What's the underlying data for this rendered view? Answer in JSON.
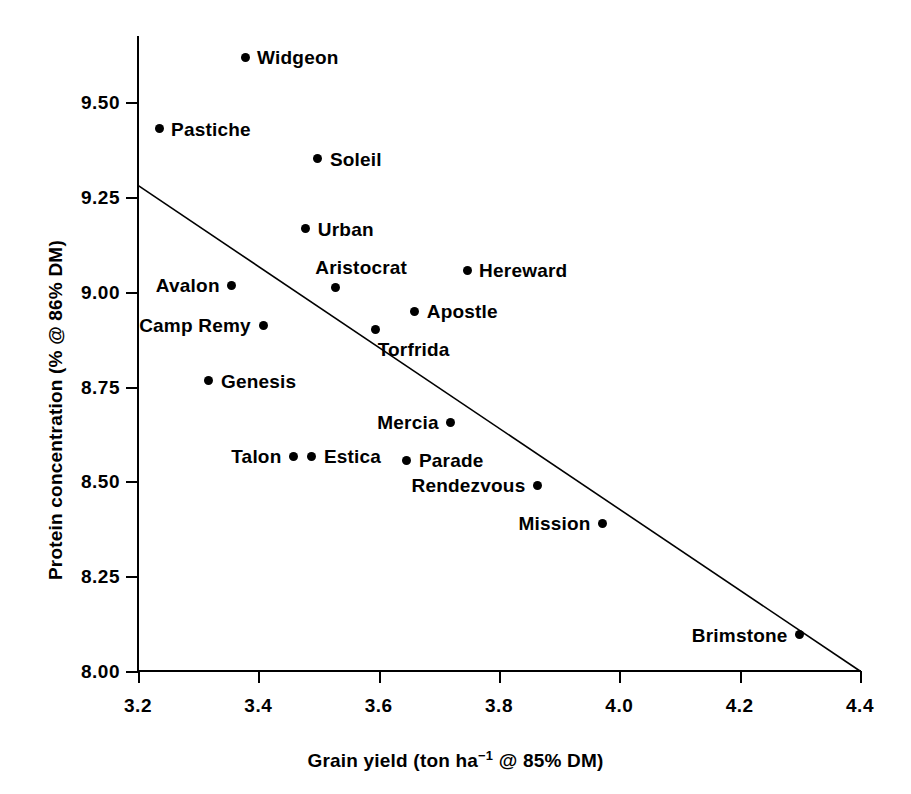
{
  "chart_data": {
    "type": "scatter",
    "title": "",
    "xlabel": "Grain yield (ton ha-1 @ 85% DM)",
    "xlabel_parts": {
      "pre": "Grain yield (ton ha",
      "sup": "−1",
      "post": " @ 85% DM)"
    },
    "ylabel": "Protein concentration (% @ 86% DM)",
    "xlim": [
      3.2,
      4.4
    ],
    "ylim": [
      8.0,
      9.625
    ],
    "xticks": [
      "3.2",
      "3.4",
      "3.6",
      "3.8",
      "4.0",
      "4.2",
      "4.4"
    ],
    "xtick_values": [
      3.2,
      3.4,
      3.6,
      3.8,
      4.0,
      4.2,
      4.4
    ],
    "yticks": [
      "9.50",
      "9.25",
      "9.00",
      "8.75",
      "8.50",
      "8.25",
      "8.00"
    ],
    "ytick_values": [
      9.5,
      9.25,
      9.0,
      8.75,
      8.5,
      8.25,
      8.0
    ],
    "grid": false,
    "legend": "none",
    "marker_color": "#000000",
    "line_color": "#000000",
    "trendline": {
      "x0": 3.2,
      "y0": 9.28,
      "x1": 4.4,
      "y1": 8.0
    },
    "points": [
      {
        "label": "Widgeon",
        "x": 3.378,
        "y": 9.618,
        "label_pos": "right"
      },
      {
        "label": "Pastiche",
        "x": 3.235,
        "y": 9.43,
        "label_pos": "right"
      },
      {
        "label": "Soleil",
        "x": 3.499,
        "y": 9.35,
        "label_pos": "right"
      },
      {
        "label": "Urban",
        "x": 3.479,
        "y": 9.166,
        "label_pos": "right"
      },
      {
        "label": "Hereward",
        "x": 3.747,
        "y": 9.057,
        "label_pos": "right"
      },
      {
        "label": "Aristocrat",
        "x": 3.528,
        "y": 9.011,
        "label_pos": "above"
      },
      {
        "label": "Avalon",
        "x": 3.356,
        "y": 9.017,
        "label_pos": "left"
      },
      {
        "label": "Apostle",
        "x": 3.66,
        "y": 8.948,
        "label_pos": "right"
      },
      {
        "label": "Camp Remy",
        "x": 3.408,
        "y": 8.912,
        "label_pos": "left"
      },
      {
        "label": "Torfrida",
        "x": 3.595,
        "y": 8.9,
        "label_pos": "below-right"
      },
      {
        "label": "Genesis",
        "x": 3.318,
        "y": 8.765,
        "label_pos": "right"
      },
      {
        "label": "Mercia",
        "x": 3.719,
        "y": 8.656,
        "label_pos": "left"
      },
      {
        "label": "Talon",
        "x": 3.458,
        "y": 8.566,
        "label_pos": "left"
      },
      {
        "label": "Estica",
        "x": 3.489,
        "y": 8.566,
        "label_pos": "right"
      },
      {
        "label": "Parade",
        "x": 3.647,
        "y": 8.555,
        "label_pos": "right"
      },
      {
        "label": "Rendezvous",
        "x": 3.864,
        "y": 8.49,
        "label_pos": "left"
      },
      {
        "label": "Mission",
        "x": 3.972,
        "y": 8.39,
        "label_pos": "left"
      },
      {
        "label": "Brimstone",
        "x": 4.3,
        "y": 8.095,
        "label_pos": "left"
      }
    ]
  }
}
